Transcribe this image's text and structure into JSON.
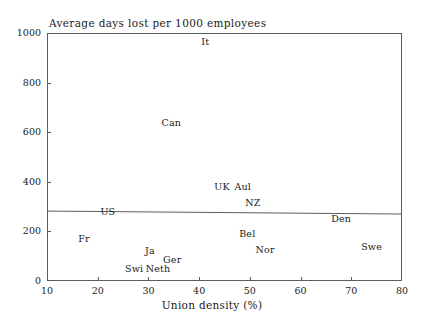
{
  "chart_data": {
    "type": "scatter",
    "title": "Average days lost per 1000 employees",
    "xlabel": "Union density (%)",
    "ylabel": "",
    "xlim": [
      10,
      80
    ],
    "ylim": [
      0,
      1000
    ],
    "xticks": [
      10,
      20,
      30,
      40,
      50,
      60,
      70,
      80
    ],
    "yticks": [
      0,
      200,
      400,
      600,
      800,
      1000
    ],
    "grid": false,
    "legend": "none",
    "point_marker": "text-label",
    "points": [
      {
        "label": "It",
        "x": 41.2,
        "y": 968
      },
      {
        "label": "Can",
        "x": 34.5,
        "y": 641
      },
      {
        "label": "UK",
        "x": 44.5,
        "y": 383
      },
      {
        "label": "Aul",
        "x": 48.6,
        "y": 383
      },
      {
        "label": "NZ",
        "x": 50.6,
        "y": 319
      },
      {
        "label": "US",
        "x": 22.0,
        "y": 282
      },
      {
        "label": "Den",
        "x": 68.0,
        "y": 254
      },
      {
        "label": "Bel",
        "x": 49.5,
        "y": 194
      },
      {
        "label": "Fr",
        "x": 17.3,
        "y": 173
      },
      {
        "label": "Swe",
        "x": 74.0,
        "y": 141
      },
      {
        "label": "Nor",
        "x": 53.0,
        "y": 129
      },
      {
        "label": "Ja",
        "x": 30.3,
        "y": 125
      },
      {
        "label": "Ger",
        "x": 34.7,
        "y": 89
      },
      {
        "label": "Swi",
        "x": 27.2,
        "y": 52
      },
      {
        "label": "Neth",
        "x": 31.9,
        "y": 52
      }
    ],
    "fit_line": {
      "name": "regression-line",
      "x_start": 10,
      "y_start": 282,
      "x_end": 80,
      "y_end": 270,
      "color": "#5d5d5d"
    }
  },
  "axes": {
    "x_tick_labels": [
      "10",
      "20",
      "30",
      "40",
      "50",
      "60",
      "70",
      "80"
    ],
    "y_tick_labels": [
      "0",
      "200",
      "400",
      "600",
      "800",
      "1000"
    ]
  }
}
